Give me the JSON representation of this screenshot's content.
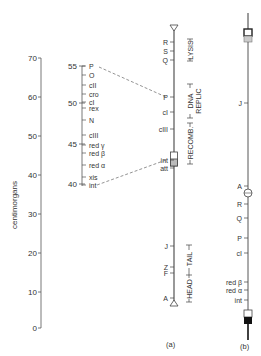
{
  "scale": {
    "label": "centimorgans",
    "ticks": [
      {
        "label": "70",
        "y": 58
      },
      {
        "label": "60",
        "y": 97
      },
      {
        "label": "50",
        "y": 136
      },
      {
        "label": "40",
        "y": 175
      },
      {
        "label": "30",
        "y": 214
      },
      {
        "label": "20",
        "y": 253
      },
      {
        "label": "10",
        "y": 292
      },
      {
        "label": "0",
        "y": 328
      }
    ]
  },
  "genetic_map": {
    "ticks": [
      {
        "label": "55",
        "y": 66
      },
      {
        "label": "50",
        "y": 103
      },
      {
        "label": "45",
        "y": 144
      },
      {
        "label": "40",
        "y": 184
      }
    ],
    "genes": [
      {
        "label": "P",
        "y": 66
      },
      {
        "label": "O",
        "y": 75
      },
      {
        "label": "cII",
        "y": 85
      },
      {
        "label": "cro",
        "y": 94
      },
      {
        "label": "cI",
        "y": 102
      },
      {
        "label": "rex",
        "y": 108
      },
      {
        "label": "N",
        "y": 120
      },
      {
        "label": "cIII",
        "y": 135
      },
      {
        "label": "red γ",
        "y": 145
      },
      {
        "label": "red β",
        "y": 153
      },
      {
        "label": "red α",
        "y": 165
      },
      {
        "label": "xis",
        "y": 177
      },
      {
        "label": "int",
        "y": 185
      }
    ]
  },
  "panel_a": {
    "caption": "(a)",
    "genes": [
      {
        "label": "R",
        "y": 42
      },
      {
        "label": "S",
        "y": 51
      },
      {
        "label": "Q",
        "y": 60
      },
      {
        "label": "P",
        "y": 97
      },
      {
        "label": "cI",
        "y": 112
      },
      {
        "label": "cIII",
        "y": 129
      },
      {
        "label": "int",
        "y": 160
      },
      {
        "label": "att",
        "y": 168
      },
      {
        "label": "J",
        "y": 246
      },
      {
        "label": "Z",
        "y": 267
      },
      {
        "label": "F",
        "y": 273
      },
      {
        "label": "A",
        "y": 298
      }
    ],
    "functions": [
      {
        "label": "LYSIS",
        "y": 50
      },
      {
        "label": "DNA REPLIC",
        "y": 101
      },
      {
        "label": "RECOMB.",
        "y": 143
      },
      {
        "label": "TAIL",
        "y": 248
      },
      {
        "label": "HEAD",
        "y": 286
      }
    ]
  },
  "panel_b": {
    "caption": "(b)",
    "genes": [
      {
        "label": "J",
        "y": 103
      },
      {
        "label": "A",
        "y": 186
      },
      {
        "label": "R",
        "y": 204
      },
      {
        "label": "Q",
        "y": 218
      },
      {
        "label": "P",
        "y": 238
      },
      {
        "label": "cI",
        "y": 253
      },
      {
        "label": "red β",
        "y": 282
      },
      {
        "label": "red α",
        "y": 290
      },
      {
        "label": "int",
        "y": 300
      }
    ]
  }
}
